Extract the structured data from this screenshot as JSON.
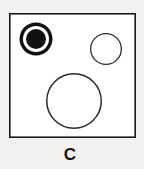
{
  "figure": {
    "label": "C",
    "background_color": "#f2f1ef",
    "panel": {
      "name": "bounding-square",
      "fill": "#ffffff",
      "stroke": "#1a1a1a",
      "stroke_width": 1.6,
      "x": 9,
      "y": 13,
      "width": 127,
      "height": 125
    },
    "shapes": [
      {
        "id": "filled-target-circle",
        "type": "concentric-circle",
        "description": "black filled dot inside white gap inside black ring",
        "cx": 36,
        "cy": 39,
        "outer_radius": 16.5,
        "gap_radius": 13,
        "inner_radius": 10,
        "ring_color": "#111111",
        "gap_color": "#ffffff",
        "fill_color": "#111111"
      },
      {
        "id": "small-open-circle",
        "type": "circle",
        "description": "small unfilled outline circle, upper right",
        "cx": 106,
        "cy": 49,
        "radius": 16,
        "fill_color": "#ffffff",
        "stroke_color": "#2a2a2a",
        "stroke_width": 1.3
      },
      {
        "id": "large-open-circle",
        "type": "circle",
        "description": "large unfilled outline circle, lower center",
        "cx": 74,
        "cy": 101,
        "radius": 28,
        "fill_color": "#ffffff",
        "stroke_color": "#2a2a2a",
        "stroke_width": 1.5
      }
    ],
    "caption": {
      "text": "C",
      "x": 70,
      "y": 160,
      "color": "#141414"
    }
  }
}
